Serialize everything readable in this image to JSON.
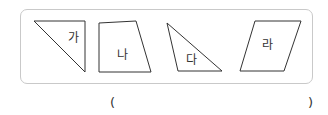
{
  "shapes": [
    {
      "label": "가",
      "type": "right-triangle"
    },
    {
      "label": "나",
      "type": "trapezoid"
    },
    {
      "label": "다",
      "type": "obtuse-triangle"
    },
    {
      "label": "라",
      "type": "parallelogram"
    }
  ],
  "answer": {
    "open_paren": "(",
    "value": "",
    "close_paren": ")"
  },
  "colors": {
    "stroke": "#333333",
    "frame": "#c9c9c9"
  }
}
